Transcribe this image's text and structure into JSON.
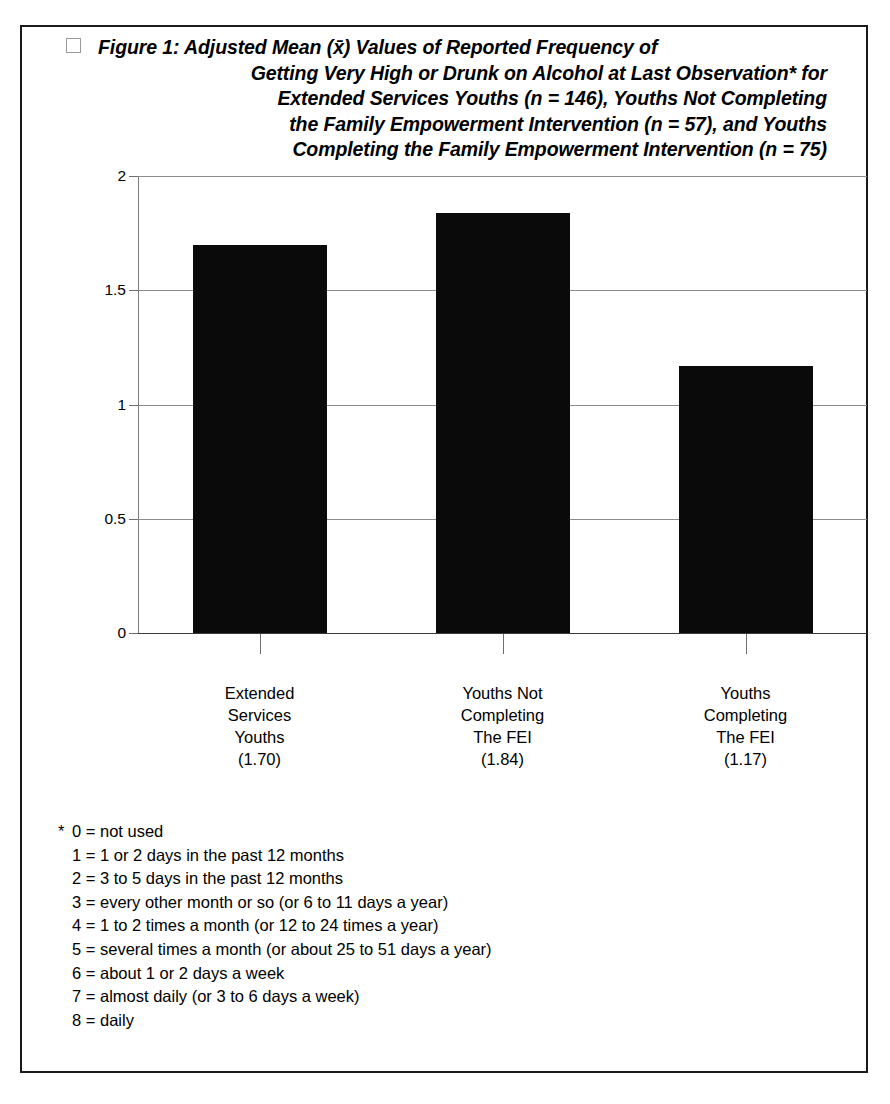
{
  "figure": {
    "checkbox_icon": "empty-square-icon",
    "title_lines": [
      "Figure 1: Adjusted Mean (x̄) Values of Reported Frequency of",
      "Getting Very High or Drunk on Alcohol at Last Observation* for",
      "Extended Services Youths (n = 146), Youths Not Completing",
      "the Family Empowerment Intervention (n = 57), and Youths",
      "Completing the  Family Empowerment Intervention  (n = 75)"
    ]
  },
  "chart_data": {
    "type": "bar",
    "xlabel": "",
    "ylabel": "",
    "ylim": [
      0,
      2
    ],
    "yticks": [
      "0",
      "0.5",
      "1",
      "1.5",
      "2"
    ],
    "ytick_values": [
      0,
      0.5,
      1,
      1.5,
      2
    ],
    "grid": true,
    "legend": "none",
    "bar_color": "#0a0a0a",
    "categories": [
      "Extended Services Youths",
      "Youths Not Completing The FEI",
      "Youths Completing The FEI"
    ],
    "category_label_lines": [
      [
        "Extended",
        "Services",
        "Youths",
        "(1.70)"
      ],
      [
        "Youths Not",
        "Completing",
        "The FEI",
        "(1.84)"
      ],
      [
        "Youths",
        "Completing",
        "The FEI",
        "(1.17)"
      ]
    ],
    "values": [
      1.7,
      1.84,
      1.17
    ],
    "value_labels": [
      "(1.70)",
      "(1.84)",
      "(1.17)"
    ],
    "sample_sizes": [
      146,
      57,
      75
    ]
  },
  "footnote": {
    "marker": "*",
    "items": [
      {
        "key": "0",
        "eq": "=",
        "text": "not used"
      },
      {
        "key": "1",
        "eq": "=",
        "text": "1 or 2 days in the past 12 months"
      },
      {
        "key": "2",
        "eq": "=",
        "text": "3 to 5 days in the past 12 months"
      },
      {
        "key": "3",
        "eq": "=",
        "text": "every other month or so (or 6 to 11 days a year)"
      },
      {
        "key": "4",
        "eq": "=",
        "text": "1 to 2 times a month (or 12 to 24 times a year)"
      },
      {
        "key": "5",
        "eq": "=",
        "text": "several times a month (or about 25 to 51 days a year)"
      },
      {
        "key": "6",
        "eq": "=",
        "text": "about 1 or 2 days a week"
      },
      {
        "key": "7",
        "eq": "=",
        "text": "almost daily (or 3 to 6 days a week)"
      },
      {
        "key": "8",
        "eq": "=",
        "text": "daily"
      }
    ]
  }
}
